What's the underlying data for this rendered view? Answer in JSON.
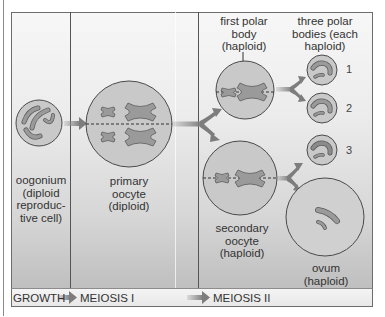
{
  "diagram": {
    "type": "oogenesis",
    "colors": {
      "cell_fill": "#c9c9c9",
      "cell_stroke": "#4a4a4a",
      "chromosome_fill": "#9a9a9a",
      "chromosome_stroke": "#5c5c5c",
      "arrow": "#8d8d8d",
      "text": "#333333"
    },
    "labels": {
      "oogonium": "oogonium\n(diploid\nreproduc-\ntive cell)",
      "primary_oocyte": "primary\noocyte\n(diploid)",
      "first_polar_body": "first polar\nbody\n(haploid)",
      "three_polar_bodies": "three polar\nbodies (each\nhaploid)",
      "secondary_oocyte": "secondary\noocyte\n(haploid)",
      "ovum": "ovum\n(haploid)"
    },
    "polar_body_numbers": [
      "1",
      "2",
      "3"
    ],
    "phases": [
      "GROWTH",
      "MEIOSIS I",
      "MEIOSIS II"
    ]
  }
}
